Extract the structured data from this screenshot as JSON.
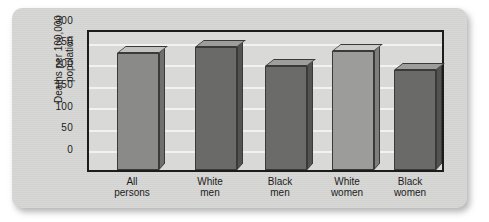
{
  "chart_data": {
    "type": "bar",
    "title": "",
    "xlabel": "",
    "ylabel": "Deaths per 100,000 population",
    "categories": [
      "All persons",
      "White men",
      "Black men",
      "White women",
      "Black women"
    ],
    "category_lines": [
      [
        "All",
        "persons"
      ],
      [
        "White",
        "men"
      ],
      [
        "Black",
        "men"
      ],
      [
        "White",
        "women"
      ],
      [
        "Black",
        "women"
      ]
    ],
    "values": [
      279,
      293,
      247,
      284,
      238
    ],
    "ylim": [
      0,
      300
    ],
    "yticks": [
      0,
      50,
      100,
      150,
      200,
      250,
      300
    ],
    "ytick_labels": [
      "0",
      "50",
      "100",
      "150",
      "200",
      "250",
      "300"
    ],
    "grid": true,
    "legend": "none",
    "bar_colors": [
      "#8a8a88",
      "#6a6a68",
      "#6b6b69",
      "#9c9c9a",
      "#6a6a68"
    ],
    "bar_top_colors": [
      "#c2c2c0",
      "#9d9d9b",
      "#9e9e9c",
      "#cccccb",
      "#9d9d9b"
    ],
    "bar_side_colors": [
      "#6f6f6d",
      "#535351",
      "#545452",
      "#7e7e7c",
      "#535351"
    ],
    "plot_background": "#d9d9d7",
    "gridline_color": "#f2f2f0",
    "axis_color": "#1c1c1c",
    "card_background": "#d6d6d4",
    "page_background": "#ffffff"
  }
}
